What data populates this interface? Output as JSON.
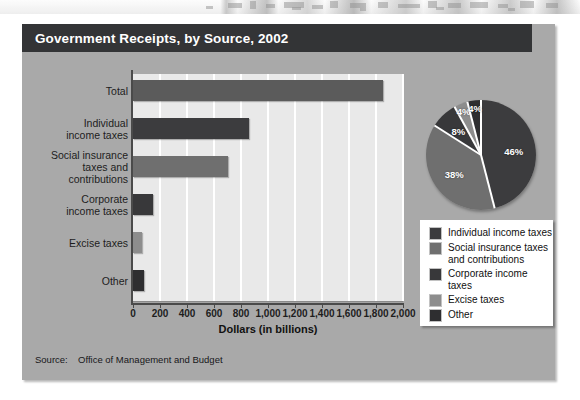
{
  "figure": {
    "title": "Government Receipts, by Source, 2002",
    "source_label": "Source:",
    "source_value": "Office of Management and Budget"
  },
  "chart_data": [
    {
      "type": "bar",
      "orientation": "horizontal",
      "title": "Government Receipts, by Source, 2002",
      "categories": [
        "Total",
        "Individual\nincome taxes",
        "Social insurance\ntaxes and\ncontributions",
        "Corporate\nincome taxes",
        "Excise taxes",
        "Other"
      ],
      "values": [
        1853,
        858,
        701,
        148,
        67,
        79
      ],
      "xlabel": "Dollars (in billions)",
      "ylabel": "",
      "xlim": [
        0,
        2000
      ],
      "xticks": [
        0,
        200,
        400,
        600,
        800,
        1000,
        1200,
        1400,
        1600,
        1800,
        2000
      ],
      "xticklabels": [
        "0",
        "200",
        "400",
        "600",
        "800",
        "1,000",
        "1,200",
        "1,400",
        "1,600",
        "1,800",
        "2,000"
      ],
      "grid": "vertical",
      "bar_colors": [
        "#5b5b5b",
        "#3c3c3e",
        "#6f6f6f",
        "#38383a",
        "#8d8d8d",
        "#2e2e30"
      ]
    },
    {
      "type": "pie",
      "labels": [
        "Individual income taxes",
        "Social insurance taxes and contributions",
        "Corporate income taxes",
        "Excise taxes",
        "Other"
      ],
      "values": [
        46,
        38,
        8,
        4,
        4
      ],
      "value_labels": [
        "46%",
        "38%",
        "8%",
        "4%",
        "4%"
      ],
      "colors": [
        "#3c3c3e",
        "#6f6f6f",
        "#38383a",
        "#8d8d8d",
        "#2e2e30"
      ],
      "legend_position": "below"
    }
  ],
  "bars": [
    {
      "label_line1": "Total",
      "label_line2": "",
      "label_line3": "",
      "value": 1853,
      "color": "#5b5b5b"
    },
    {
      "label_line1": "Individual",
      "label_line2": "income taxes",
      "label_line3": "",
      "value": 858,
      "color": "#3c3c3e"
    },
    {
      "label_line1": "Social insurance",
      "label_line2": "taxes and",
      "label_line3": "contributions",
      "value": 701,
      "color": "#6f6f6f"
    },
    {
      "label_line1": "Corporate",
      "label_line2": "income taxes",
      "label_line3": "",
      "value": 148,
      "color": "#38383a"
    },
    {
      "label_line1": "Excise taxes",
      "label_line2": "",
      "label_line3": "",
      "value": 67,
      "color": "#8d8d8d"
    },
    {
      "label_line1": "Other",
      "label_line2": "",
      "label_line3": "",
      "value": 79,
      "color": "#2e2e30"
    }
  ],
  "axis": {
    "x_title": "Dollars (in billions)",
    "ticks": [
      "0",
      "200",
      "400",
      "600",
      "800",
      "1,000",
      "1,200",
      "1,400",
      "1,600",
      "1,800",
      "2,000"
    ]
  },
  "pie": {
    "slices": [
      {
        "pct_label": "46%",
        "value": 46,
        "color": "#3c3c3e"
      },
      {
        "pct_label": "38%",
        "value": 38,
        "color": "#6f6f6f"
      },
      {
        "pct_label": "8%",
        "value": 8,
        "color": "#38383a"
      },
      {
        "pct_label": "4%",
        "value": 4,
        "color": "#8d8d8d"
      },
      {
        "pct_label": "4%",
        "value": 4,
        "color": "#2e2e30"
      }
    ]
  },
  "legend": {
    "items": [
      {
        "label_line1": "Individual income taxes",
        "label_line2": "",
        "color": "#3c3c3e"
      },
      {
        "label_line1": "Social insurance taxes",
        "label_line2": "and contributions",
        "color": "#6f6f6f"
      },
      {
        "label_line1": "Corporate income taxes",
        "label_line2": "",
        "color": "#38383a"
      },
      {
        "label_line1": "Excise taxes",
        "label_line2": "",
        "color": "#8d8d8d"
      },
      {
        "label_line1": "Other",
        "label_line2": "",
        "color": "#2e2e30"
      }
    ]
  }
}
